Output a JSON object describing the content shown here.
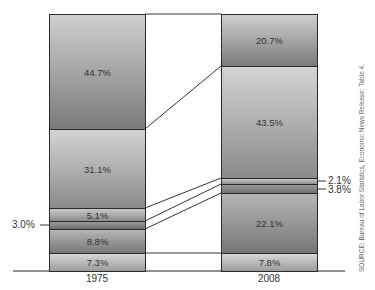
{
  "chart_data": {
    "type": "bar",
    "subtype": "stacked-100-percent",
    "title": "",
    "xlabel": "",
    "ylabel": "",
    "categories": [
      "1975",
      "2008"
    ],
    "series_order_bottom_to_top": [
      "s1",
      "s2",
      "s3",
      "s4",
      "s5",
      "s6"
    ],
    "series": [
      {
        "name": "s1",
        "values": [
          7.3,
          7.8
        ],
        "labels": [
          "7.3%",
          "7.8%"
        ]
      },
      {
        "name": "s2",
        "values": [
          8.8,
          22.1
        ],
        "labels": [
          "8.8%",
          "22.1%"
        ]
      },
      {
        "name": "s3",
        "values": [
          3.0,
          3.8
        ],
        "labels": [
          "3.0%",
          "3.8%"
        ]
      },
      {
        "name": "s4",
        "values": [
          5.1,
          2.1
        ],
        "labels": [
          "5.1%",
          "2.1%"
        ]
      },
      {
        "name": "s5",
        "values": [
          31.1,
          43.5
        ],
        "labels": [
          "31.1%",
          "43.5%"
        ]
      },
      {
        "name": "s6",
        "values": [
          44.7,
          20.7
        ],
        "labels": [
          "44.7%",
          "20.7%"
        ]
      }
    ],
    "ylim": [
      0,
      100
    ],
    "grid": false,
    "legend": "none",
    "connector_lines": true,
    "source": "SOURCE: Bureau of Labor Statistics, Economic News Release: Table 4."
  },
  "bars": {
    "left": {
      "category": "1975",
      "segments": [
        {
          "label": "44.7%",
          "top": 14,
          "height": 115,
          "color_top": "#cfcfcf",
          "color_bottom": "#7a7a7a"
        },
        {
          "label": "31.1%",
          "top": 129,
          "height": 79,
          "color_top": "#d4d4d4",
          "color_bottom": "#8a8a8a"
        },
        {
          "label": "5.1%",
          "top": 208,
          "height": 13,
          "color_top": "#c8c8c8",
          "color_bottom": "#8c8c8c"
        },
        {
          "label": "",
          "top": 221,
          "height": 8,
          "color_top": "#9a9a9a",
          "color_bottom": "#6f6f6f"
        },
        {
          "label": "8.8%",
          "top": 229,
          "height": 24,
          "color_top": "#b5b5b5",
          "color_bottom": "#777777"
        },
        {
          "label": "7.3%",
          "top": 253,
          "height": 18,
          "color_top": "#d6d6d6",
          "color_bottom": "#9c9c9c"
        }
      ]
    },
    "right": {
      "category": "2008",
      "segments": [
        {
          "label": "20.7%",
          "top": 14,
          "height": 52,
          "color_top": "#cfcfcf",
          "color_bottom": "#7a7a7a"
        },
        {
          "label": "43.5%",
          "top": 66,
          "height": 112,
          "color_top": "#d4d4d4",
          "color_bottom": "#8a8a8a"
        },
        {
          "label": "",
          "top": 178,
          "height": 6,
          "color_top": "#c8c8c8",
          "color_bottom": "#8c8c8c"
        },
        {
          "label": "",
          "top": 184,
          "height": 9,
          "color_top": "#9a9a9a",
          "color_bottom": "#6f6f6f"
        },
        {
          "label": "22.1%",
          "top": 193,
          "height": 60,
          "color_top": "#b5b5b5",
          "color_bottom": "#777777"
        },
        {
          "label": "7.8%",
          "top": 253,
          "height": 18,
          "color_top": "#d6d6d6",
          "color_bottom": "#9c9c9c"
        }
      ]
    }
  },
  "callouts": {
    "left_small": "3.0%",
    "right_a": "2.1%",
    "right_b": "3.8%"
  },
  "axis": {
    "x_labels": [
      "1975",
      "2008"
    ]
  },
  "source_note": "SOURCE: Bureau of Labor Statistics, Economic News Release: Table 4."
}
